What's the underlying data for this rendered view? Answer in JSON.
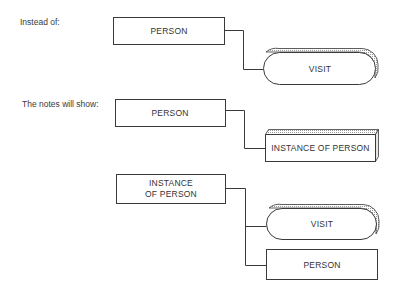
{
  "captions": {
    "instead_of": "Instead of:",
    "notes_will_show": "The notes will show:"
  },
  "diagram_1": {
    "parent": {
      "label": "PERSON",
      "shape": "rectangle"
    },
    "child": {
      "label": "VISIT",
      "shape": "rounded-3d"
    }
  },
  "diagram_2": {
    "parent": {
      "label": "PERSON",
      "shape": "rectangle"
    },
    "child": {
      "label": "INSTANCE OF PERSON",
      "shape": "box-3d"
    }
  },
  "diagram_3": {
    "parent": {
      "label_line1": "INSTANCE",
      "label_line2": "OF PERSON",
      "shape": "rectangle"
    },
    "children": [
      {
        "label": "VISIT",
        "shape": "rounded-3d"
      },
      {
        "label": "PERSON",
        "shape": "rectangle"
      }
    ]
  },
  "colors": {
    "line": "#3a3a3a",
    "shadow": "#d8d8d8",
    "background": "#ffffff"
  }
}
